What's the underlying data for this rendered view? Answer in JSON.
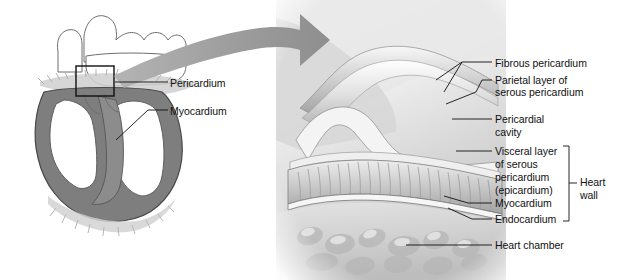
{
  "figure": {
    "background_color": "#ffffff",
    "text_color": "#111111"
  },
  "left_panel": {
    "caption": "frontal section of heart showing pericardium location",
    "labels": [
      {
        "id": "pericardium",
        "text": "Pericardium",
        "x": 170,
        "y": 77
      },
      {
        "id": "myocardium",
        "text": "Myocardium",
        "x": 170,
        "y": 105
      }
    ]
  },
  "arrow": {
    "name": "magnification-arrow",
    "color": "#9a9a9a",
    "direction": "left-to-right-curved"
  },
  "right_panel": {
    "caption": "magnified view of pericardial layers and heart wall",
    "labels": [
      {
        "id": "fibrous-pericardium",
        "text": "Fibrous pericardium",
        "x": 495,
        "y": 57
      },
      {
        "id": "parietal-layer-1",
        "text": "Parietal layer of",
        "x": 495,
        "y": 77
      },
      {
        "id": "parietal-layer-2",
        "text": "serous pericardium",
        "x": 495,
        "y": 89
      },
      {
        "id": "pericardial-cavity-1",
        "text": "Pericardial",
        "x": 495,
        "y": 114
      },
      {
        "id": "pericardial-cavity-2",
        "text": "cavity",
        "x": 495,
        "y": 127
      },
      {
        "id": "visceral-layer-1",
        "text": "Visceral layer",
        "x": 495,
        "y": 146
      },
      {
        "id": "visceral-layer-2",
        "text": "of serous",
        "x": 495,
        "y": 159
      },
      {
        "id": "visceral-layer-3",
        "text": "pericardium",
        "x": 495,
        "y": 172
      },
      {
        "id": "visceral-layer-4",
        "text": "(epicardium)",
        "x": 495,
        "y": 185
      },
      {
        "id": "myocardium-right",
        "text": "Myocardium",
        "x": 495,
        "y": 198
      },
      {
        "id": "endocardium",
        "text": "Endocardium",
        "x": 495,
        "y": 214
      },
      {
        "id": "heart-chamber",
        "text": "Heart chamber",
        "x": 495,
        "y": 240
      }
    ],
    "bracket": {
      "id": "heart-wall-bracket",
      "label_line_1": "Heart",
      "label_line_2": "wall",
      "label_x": 580,
      "label_y_1": 176,
      "label_y_2": 189
    }
  }
}
